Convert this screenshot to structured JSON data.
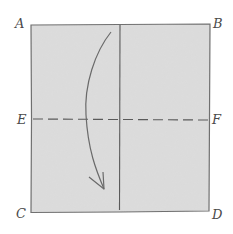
{
  "diagram": {
    "type": "origami-fold-step",
    "colors": {
      "paper_fill": "#dcdcdc",
      "outline": "#6e6e6e",
      "crease": "#5a5a5a",
      "arrow": "#6a6a6a",
      "label": "#4a4a4a"
    },
    "corners": {
      "top_left": "A",
      "top_right": "B",
      "bottom_left": "C",
      "bottom_right": "D"
    },
    "midpoints": {
      "left": "E",
      "right": "F"
    },
    "lines": [
      {
        "name": "center-vertical-crease",
        "style": "solid",
        "from": "top edge midpoint",
        "to": "bottom edge midpoint"
      },
      {
        "name": "horizontal-fold-line",
        "style": "dashed",
        "from": "E",
        "to": "F"
      }
    ],
    "arrow": {
      "direction": "down",
      "meaning": "fold top half down along E-F"
    }
  }
}
